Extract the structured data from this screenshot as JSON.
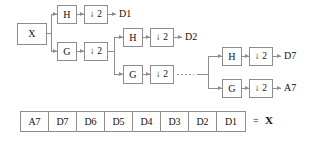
{
  "diagram": {
    "input": {
      "label": "X"
    },
    "downsample_label": "2",
    "downsample_arrow": "↓",
    "stages": [
      {
        "name": "stage-1",
        "highpass": {
          "label": "H",
          "downsample": "↓ 2",
          "output": "D1"
        },
        "lowpass": {
          "label": "G",
          "downsample": "↓ 2",
          "output": ""
        }
      },
      {
        "name": "stage-2",
        "highpass": {
          "label": "H",
          "downsample": "↓ 2",
          "output": "D2"
        },
        "lowpass": {
          "label": "G",
          "downsample": "↓ 2",
          "output": ""
        }
      },
      {
        "name": "stage-7",
        "highpass": {
          "label": "H",
          "downsample": "↓ 2",
          "output": "D7"
        },
        "lowpass": {
          "label": "G",
          "downsample": "↓ 2",
          "output": "A7"
        }
      }
    ],
    "continuation": "······"
  },
  "vector": {
    "cells": [
      "A7",
      "D7",
      "D6",
      "D5",
      "D4",
      "D3",
      "D2",
      "D1"
    ],
    "equals": "=",
    "result": "X"
  },
  "colors": {
    "stroke": "#8d8d8d",
    "text": "#111111",
    "background": "#ffffff"
  }
}
